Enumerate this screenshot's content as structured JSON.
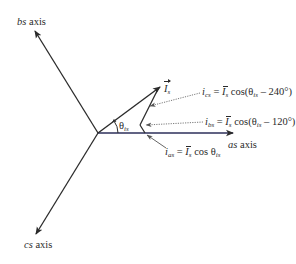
{
  "figure": {
    "colors": {
      "axis": "#2b2b2b",
      "as_axis": "#2c2f5a",
      "leader": "#6a6a6a",
      "text": "#2a2a2a"
    },
    "axes": {
      "as": {
        "name": "as",
        "suffix": " axis"
      },
      "bs": {
        "name": "bs",
        "suffix": " axis"
      },
      "cs": {
        "name": "cs",
        "suffix": " axis"
      }
    },
    "vector": {
      "symbol": "I",
      "subscript": "s"
    },
    "angle": {
      "symbol": "θ",
      "subscript": "is"
    },
    "equations": {
      "cs": {
        "lhs": "i",
        "lhs_sub": "cs",
        "eq": " = ",
        "amp": "I",
        "amp_sub": "s",
        "func": " cos(θ",
        "theta_sub": "is",
        "tail": " – 240°)"
      },
      "bs": {
        "lhs": "i",
        "lhs_sub": "bs",
        "eq": " = ",
        "amp": "I",
        "amp_sub": "s",
        "func": " cos(θ",
        "theta_sub": "is",
        "tail": " – 120°)"
      },
      "as": {
        "lhs": "i",
        "lhs_sub": "as",
        "eq": " = ",
        "amp": "I",
        "amp_sub": "s",
        "func": " cos θ",
        "theta_sub": "is"
      }
    }
  }
}
